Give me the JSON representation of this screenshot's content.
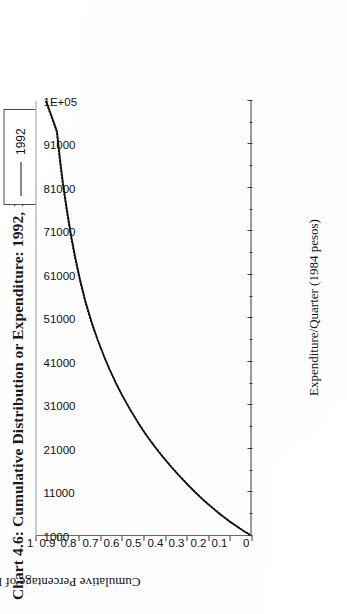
{
  "chart_data": {
    "type": "line",
    "title": "Chart 4.6: Cumulative Distribution or Expenditure: 1992, 1994",
    "xlabel": "Expenditure/Quarter (1984 pesos)",
    "ylabel": "Cumulative Percentage of Population",
    "xlim": [
      1000,
      101000
    ],
    "ylim": [
      0,
      1
    ],
    "grid": false,
    "legend_position": "top-right",
    "xticks": [
      1000,
      11000,
      21000,
      31000,
      41000,
      51000,
      61000,
      71000,
      81000,
      91000,
      101000
    ],
    "xtick_labels": [
      "1000",
      "11000",
      "21000",
      "31000",
      "41000",
      "51000",
      "61000",
      "71000",
      "81000",
      "91000",
      "1E+05"
    ],
    "xtick_minor_count": 1,
    "yticks": [
      0,
      0.1,
      0.2,
      0.3,
      0.4,
      0.5,
      0.6,
      0.7,
      0.8,
      0.9,
      1
    ],
    "ytick_labels": [
      "0",
      "0.1",
      "0.2",
      "0.3",
      "0.4",
      "0.5",
      "0.6",
      "0.7",
      "0.8",
      "0.9",
      "1"
    ],
    "series": [
      {
        "name": "1992",
        "style": "solid",
        "color": "#111111",
        "x": [
          1000,
          2000,
          3000,
          4000,
          5000,
          6000,
          7000,
          8000,
          9000,
          10000,
          11000,
          13000,
          15000,
          17000,
          19000,
          21000,
          24000,
          27000,
          30000,
          33000,
          36000,
          39000,
          42000,
          46000,
          50000,
          55000,
          60000,
          65000,
          70000,
          76000,
          82000,
          88000,
          94000,
          101000
        ],
        "y": [
          0.0,
          0.035,
          0.065,
          0.095,
          0.122,
          0.148,
          0.172,
          0.196,
          0.219,
          0.241,
          0.262,
          0.302,
          0.34,
          0.376,
          0.41,
          0.442,
          0.487,
          0.527,
          0.564,
          0.598,
          0.629,
          0.657,
          0.683,
          0.714,
          0.742,
          0.772,
          0.797,
          0.819,
          0.838,
          0.858,
          0.876,
          0.891,
          0.904,
          0.955
        ]
      },
      {
        "name": "1994",
        "style": "dotted",
        "color": "#111111",
        "x": [
          1000,
          2000,
          3000,
          4000,
          5000,
          6000,
          7000,
          8000,
          9000,
          10000,
          11000,
          13000,
          15000,
          17000,
          19000,
          21000,
          24000,
          27000,
          30000,
          33000,
          36000,
          39000,
          42000,
          46000,
          50000,
          55000,
          60000,
          65000,
          70000,
          76000,
          82000,
          88000,
          94000,
          101000
        ],
        "y": [
          0.0,
          0.033,
          0.062,
          0.091,
          0.118,
          0.144,
          0.169,
          0.193,
          0.216,
          0.238,
          0.259,
          0.299,
          0.337,
          0.373,
          0.408,
          0.44,
          0.485,
          0.525,
          0.562,
          0.597,
          0.628,
          0.657,
          0.684,
          0.716,
          0.745,
          0.775,
          0.8,
          0.822,
          0.841,
          0.861,
          0.879,
          0.894,
          0.907,
          0.958
        ]
      }
    ]
  },
  "legend": {
    "entries": [
      {
        "label": "1992",
        "style": "solid"
      },
      {
        "label": "1994",
        "style": "dotted"
      }
    ]
  }
}
